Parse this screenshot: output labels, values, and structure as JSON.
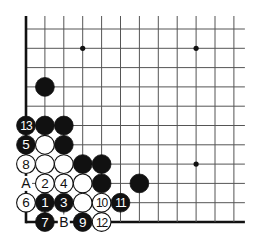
{
  "diagram": {
    "type": "go-board-corner",
    "grid": {
      "cols": 12,
      "rows": 11,
      "x0": 26,
      "y0": 29,
      "dx": 18.9,
      "dy": 19.3,
      "line_extend_top": 13,
      "line_extend_right": 11,
      "edges": [
        "left",
        "bottom"
      ]
    },
    "star_points": [
      {
        "col": 3,
        "row": 1
      },
      {
        "col": 9,
        "row": 1
      },
      {
        "col": 9,
        "row": 7
      }
    ],
    "stones": [
      {
        "col": 1,
        "row": 3,
        "color": "black",
        "label": ""
      },
      {
        "col": 0,
        "row": 5,
        "color": "black",
        "label": "13"
      },
      {
        "col": 1,
        "row": 5,
        "color": "black",
        "label": ""
      },
      {
        "col": 2,
        "row": 5,
        "color": "black",
        "label": ""
      },
      {
        "col": 0,
        "row": 6,
        "color": "black",
        "label": "5"
      },
      {
        "col": 1,
        "row": 6,
        "color": "white",
        "label": ""
      },
      {
        "col": 2,
        "row": 6,
        "color": "black",
        "label": ""
      },
      {
        "col": 0,
        "row": 7,
        "color": "white",
        "label": "8"
      },
      {
        "col": 1,
        "row": 7,
        "color": "white",
        "label": ""
      },
      {
        "col": 2,
        "row": 7,
        "color": "white",
        "label": ""
      },
      {
        "col": 3,
        "row": 7,
        "color": "black",
        "label": ""
      },
      {
        "col": 4,
        "row": 7,
        "color": "black",
        "label": ""
      },
      {
        "col": 1,
        "row": 8,
        "color": "white",
        "label": "2"
      },
      {
        "col": 2,
        "row": 8,
        "color": "white",
        "label": "4"
      },
      {
        "col": 3,
        "row": 8,
        "color": "white",
        "label": ""
      },
      {
        "col": 4,
        "row": 8,
        "color": "black",
        "label": ""
      },
      {
        "col": 6,
        "row": 8,
        "color": "black",
        "label": ""
      },
      {
        "col": 0,
        "row": 9,
        "color": "white",
        "label": "6"
      },
      {
        "col": 1,
        "row": 9,
        "color": "black",
        "label": "1"
      },
      {
        "col": 2,
        "row": 9,
        "color": "black",
        "label": "3"
      },
      {
        "col": 3,
        "row": 9,
        "color": "white",
        "label": ""
      },
      {
        "col": 4,
        "row": 9,
        "color": "white",
        "label": "10"
      },
      {
        "col": 5,
        "row": 9,
        "color": "black",
        "label": "11"
      },
      {
        "col": 1,
        "row": 10,
        "color": "black",
        "label": "7"
      },
      {
        "col": 3,
        "row": 10,
        "color": "black",
        "label": "9"
      },
      {
        "col": 4,
        "row": 10,
        "color": "white",
        "label": "12"
      }
    ],
    "point_labels": [
      {
        "col": 0,
        "row": 8,
        "text": "A"
      },
      {
        "col": 2,
        "row": 10,
        "text": "B"
      }
    ],
    "colors": {
      "line": "#555555",
      "edge": "#111111",
      "black_stone": "#111111",
      "white_stone": "#ffffff",
      "stone_outline": "#111111"
    }
  }
}
